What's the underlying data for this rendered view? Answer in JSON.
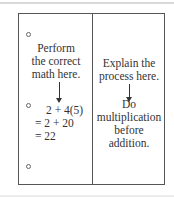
{
  "notes": {
    "left_column": {
      "instruction": [
        "Perform",
        "the correct",
        "math here."
      ],
      "math_lines": [
        "2 + 4(5)",
        "= 2 + 20",
        "= 22"
      ]
    },
    "right_column": {
      "instruction": [
        "Explain the",
        "process here."
      ],
      "explanation": [
        "Do",
        "multiplication",
        "before",
        "addition."
      ]
    },
    "colors": {
      "border": "#555555",
      "text": "#333333"
    }
  }
}
